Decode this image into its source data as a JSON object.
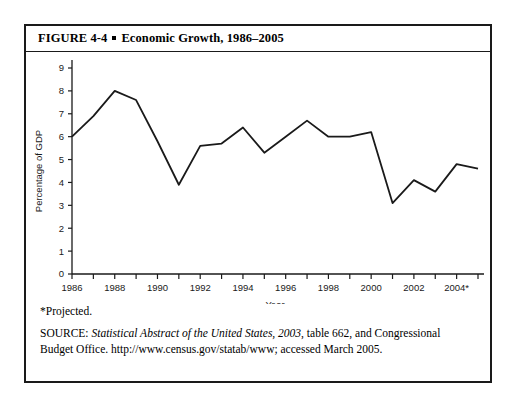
{
  "figure": {
    "number_label": "FIGURE 4-4",
    "bullet": "square-bullet",
    "title": "Economic Growth, 1986–2005"
  },
  "notes": {
    "projected": "*Projected.",
    "source_prefix": "SOURCE: ",
    "source_italic": "Statistical Abstract of the United States, 2003",
    "source_rest": ", table 662, and Congressional Budget Office. http://www.census.gov/statab/www; accessed March 2005."
  },
  "chart_data": {
    "type": "line",
    "title": "Economic Growth, 1986–2005",
    "xlabel": "Year",
    "ylabel": "Percentage of GDP",
    "xlim": [
      1986,
      2005
    ],
    "ylim": [
      0,
      9
    ],
    "yticks": [
      "0",
      "1",
      "2",
      "3",
      "4",
      "5",
      "6",
      "7",
      "8",
      "9"
    ],
    "xticks_labeled": [
      "1986",
      "1988",
      "1990",
      "1992",
      "1994",
      "1996",
      "1998",
      "2000",
      "2002",
      "2004*"
    ],
    "grid": false,
    "legend": "none",
    "x": [
      1986,
      1987,
      1988,
      1989,
      1990,
      1991,
      1992,
      1993,
      1994,
      1995,
      1996,
      1997,
      1998,
      1999,
      2000,
      2001,
      2002,
      2003,
      2004,
      2005
    ],
    "x_labels": [
      "1986",
      "1987",
      "1988",
      "1989",
      "1990",
      "1991",
      "1992",
      "1993",
      "1994",
      "1995",
      "1996",
      "1997",
      "1998",
      "1999",
      "2000",
      "2001",
      "2002",
      "2003",
      "2004*",
      "2005*"
    ],
    "values": [
      6.0,
      6.9,
      8.0,
      7.6,
      5.8,
      3.9,
      5.6,
      5.7,
      6.4,
      5.3,
      6.0,
      6.7,
      6.0,
      6.0,
      6.2,
      3.1,
      4.1,
      3.6,
      4.8,
      4.6
    ],
    "series": [
      {
        "name": "Percentage of GDP",
        "values": [
          6.0,
          6.9,
          8.0,
          7.6,
          5.8,
          3.9,
          5.6,
          5.7,
          6.4,
          5.3,
          6.0,
          6.7,
          6.0,
          6.0,
          6.2,
          3.1,
          4.1,
          3.6,
          4.8,
          4.6
        ],
        "color": "#1a1a1a"
      }
    ]
  }
}
